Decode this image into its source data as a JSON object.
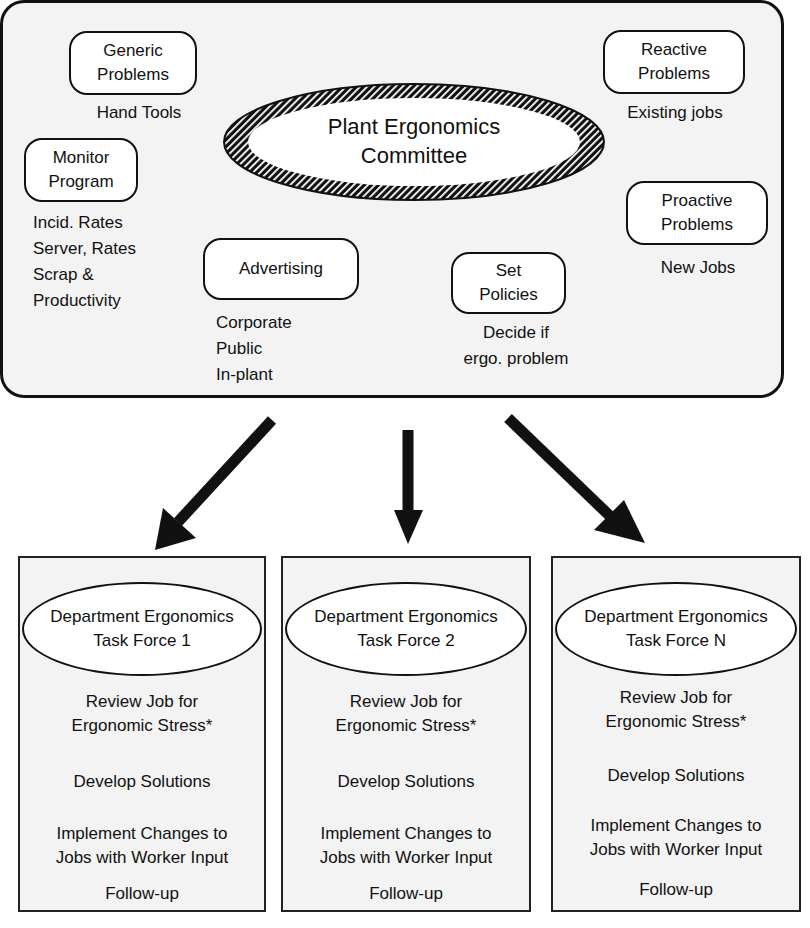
{
  "committee": {
    "title_line1": "Plant Ergonomics",
    "title_line2": "Committee",
    "functions": [
      {
        "label_line1": "Generic",
        "label_line2": "Problems",
        "details": [
          "Hand Tools"
        ]
      },
      {
        "label_line1": "Monitor",
        "label_line2": "Program",
        "details": [
          "Incid. Rates",
          "Server, Rates",
          "Scrap &",
          "Productivity"
        ]
      },
      {
        "label_line1": "Advertising",
        "label_line2": "",
        "details": [
          "Corporate",
          "Public",
          "In-plant"
        ]
      },
      {
        "label_line1": "Set",
        "label_line2": "Policies",
        "details": [
          "Decide if",
          "ergo. problem"
        ]
      },
      {
        "label_line1": "Reactive",
        "label_line2": "Problems",
        "details": [
          "Existing jobs"
        ]
      },
      {
        "label_line1": "Proactive",
        "label_line2": "Problems",
        "details": [
          "New Jobs"
        ]
      }
    ]
  },
  "task_forces": [
    {
      "title_line1": "Department Ergonomics",
      "title_line2": "Task Force 1",
      "steps": {
        "review_1": "Review Job for",
        "review_2": "Ergonomic Stress*",
        "develop": "Develop Solutions",
        "implement_1": "Implement Changes to",
        "implement_2": "Jobs with Worker Input",
        "follow": "Follow-up"
      }
    },
    {
      "title_line1": "Department Ergonomics",
      "title_line2": "Task Force 2",
      "steps": {
        "review_1": "Review Job for",
        "review_2": "Ergonomic Stress*",
        "develop": "Develop Solutions",
        "implement_1": "Implement Changes to",
        "implement_2": "Jobs with Worker Input",
        "follow": "Follow-up"
      }
    },
    {
      "title_line1": "Department Ergonomics",
      "title_line2": "Task Force N",
      "steps": {
        "review_1": "Review Job for",
        "review_2": "Ergonomic Stress*",
        "develop": "Develop Solutions",
        "implement_1": "Implement Changes to",
        "implement_2": "Jobs with Worker Input",
        "follow": "Follow-up"
      }
    }
  ],
  "colors": {
    "panel_bg": "#f3f3f3",
    "stroke": "#111111",
    "box_bg": "#ffffff"
  }
}
